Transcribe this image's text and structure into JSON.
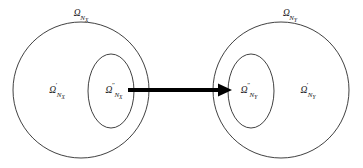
{
  "figure": {
    "type": "set-mapping-diagram",
    "background_color": "#ffffff",
    "stroke_color": "#2b2b2b",
    "arrow_color": "#000000"
  },
  "source_group": {
    "outer_label": {
      "omega": "Ω",
      "prime": "",
      "subscript": "N",
      "subsubscript": "X"
    },
    "inner_region_label": {
      "omega": "Ω",
      "prime": "′",
      "subscript": "N",
      "subsubscript": "X"
    },
    "subregion_label": {
      "omega": "Ω",
      "prime": "″",
      "subscript": "N",
      "subsubscript": "X"
    }
  },
  "target_group": {
    "outer_label": {
      "omega": "Ω",
      "prime": "",
      "subscript": "N",
      "subsubscript": "Y"
    },
    "inner_region_label": {
      "omega": "Ω",
      "prime": "′",
      "subscript": "N",
      "subsubscript": "Y"
    },
    "subregion_label": {
      "omega": "Ω",
      "prime": "″",
      "subscript": "N",
      "subsubscript": "Y"
    }
  },
  "mapping_arrow": {
    "direction": "left-to-right",
    "from": "Ω″ N_X",
    "to": "Ω″ N_Y"
  }
}
